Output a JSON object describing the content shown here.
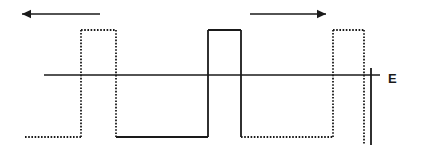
{
  "figure": {
    "axis": {
      "label": "E",
      "label_x": 388,
      "label_y": 80,
      "line_y": 75,
      "line_x_start": 44,
      "line_x_end": 380,
      "color": "#1a1a1a",
      "stroke_width": 1.6
    },
    "levels": {
      "top_y": 30,
      "bottom_y": 137,
      "zero_y": 75
    },
    "arrows": [
      {
        "name": "left-arrow",
        "direction": "left",
        "x_start": 100,
        "x_end": 22,
        "y": 14,
        "color": "#1a1a1a"
      },
      {
        "name": "right-arrow",
        "direction": "right",
        "x_start": 250,
        "x_end": 326,
        "y": 14,
        "color": "#1a1a1a"
      }
    ],
    "waveform": {
      "stroke_color": "#1a1a1a",
      "stroke_width": 1.8,
      "dash_pattern": "1.6,1.6",
      "segments": [
        {
          "name": "dotted-low-1",
          "style": "dotted",
          "type": "horizontal",
          "x1": 25,
          "x2": 81,
          "y": 137
        },
        {
          "name": "dotted-rise-1",
          "style": "dotted",
          "type": "vertical",
          "x": 81,
          "y1": 137,
          "y2": 30
        },
        {
          "name": "dotted-high-1",
          "style": "dotted",
          "type": "horizontal",
          "x1": 81,
          "x2": 116,
          "y": 30
        },
        {
          "name": "dotted-fall-1",
          "style": "dotted",
          "type": "vertical",
          "x": 116,
          "y1": 30,
          "y2": 137
        },
        {
          "name": "solid-low-1",
          "style": "solid",
          "type": "horizontal",
          "x1": 116,
          "x2": 208,
          "y": 137
        },
        {
          "name": "solid-rise-1",
          "style": "solid",
          "type": "vertical",
          "x": 208,
          "y1": 137,
          "y2": 30
        },
        {
          "name": "solid-high-1",
          "style": "solid",
          "type": "horizontal",
          "x1": 208,
          "x2": 241,
          "y": 30
        },
        {
          "name": "solid-fall-1",
          "style": "solid",
          "type": "vertical",
          "x": 241,
          "y1": 30,
          "y2": 137
        },
        {
          "name": "dotted-low-2",
          "style": "dotted",
          "type": "horizontal",
          "x1": 241,
          "x2": 333,
          "y": 137
        },
        {
          "name": "dotted-rise-2",
          "style": "dotted",
          "type": "vertical",
          "x": 333,
          "y1": 137,
          "y2": 30
        },
        {
          "name": "dotted-high-2",
          "style": "dotted",
          "type": "horizontal",
          "x1": 333,
          "x2": 364,
          "y": 30
        },
        {
          "name": "dotted-fall-2",
          "style": "dotted",
          "type": "vertical",
          "x": 364,
          "y1": 30,
          "y2": 145
        },
        {
          "name": "solid-tail-drop",
          "style": "solid",
          "type": "vertical",
          "x": 371,
          "y1": 68,
          "y2": 145
        }
      ]
    }
  }
}
